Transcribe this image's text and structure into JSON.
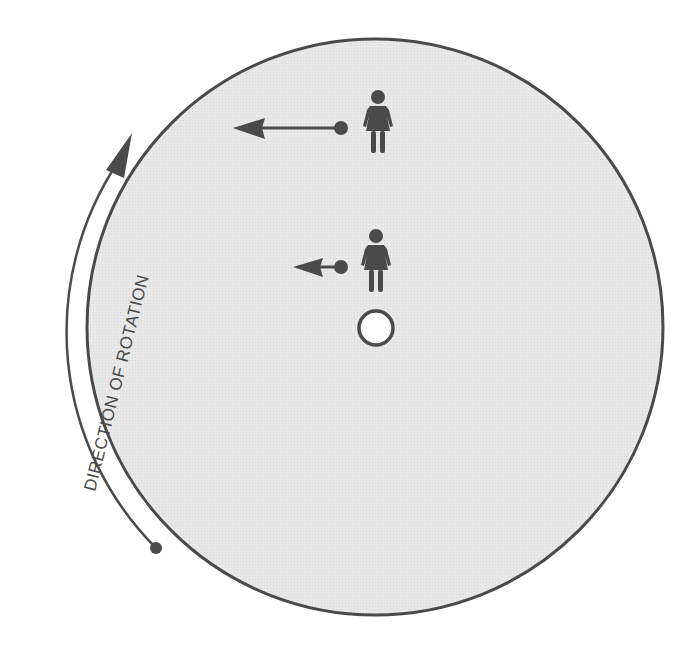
{
  "diagram": {
    "rotation_label": "DIRECTION OF ROTATION",
    "colors": {
      "disk_fill": "#e6e6e6",
      "outline": "#4a4a4a",
      "figure": "#4a4a4a",
      "hub_fill": "#ffffff",
      "background": "#ffffff"
    },
    "disk": {
      "cx": 375,
      "cy": 327,
      "r": 288
    },
    "hub": {
      "cx": 376,
      "cy": 328,
      "r": 17
    },
    "figures": [
      {
        "name": "outer-person",
        "icon": "woman-icon",
        "x": 378,
        "y": 128,
        "velocity_arrow": {
          "from_x": 341,
          "to_x": 233,
          "y": 128,
          "length": "long"
        }
      },
      {
        "name": "inner-person",
        "icon": "woman-icon",
        "x": 376,
        "y": 267,
        "velocity_arrow": {
          "from_x": 341,
          "to_x": 293,
          "y": 267,
          "length": "short"
        }
      }
    ]
  }
}
